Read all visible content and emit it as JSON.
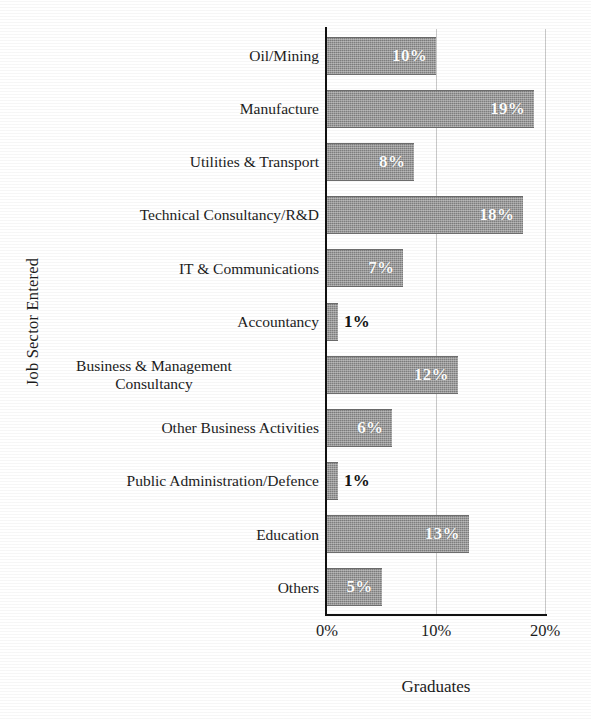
{
  "chart_data": {
    "type": "bar",
    "orientation": "horizontal",
    "title": "",
    "xlabel": "Graduates",
    "ylabel": "Job Sector Entered",
    "xlim": [
      0,
      20
    ],
    "xticks": [
      "0%",
      "10%",
      "20%"
    ],
    "xtick_values": [
      0,
      10,
      20
    ],
    "grid": "vertical gridlines at 10% and 20%",
    "legend": "none",
    "bar_color": "#7e7e7e",
    "value_label_color_inside": "#ffffff",
    "value_label_color_outside": "#141414",
    "categories": [
      "Oil/Mining",
      "Manufacture",
      "Utilities & Transport",
      "Technical Consultancy/R&D",
      "IT & Communications",
      "Accountancy",
      "Business & Management Consultancy",
      "Other Business Activities",
      "Public Administration/Defence",
      "Education",
      "Others"
    ],
    "values": [
      10,
      19,
      8,
      18,
      7,
      1,
      12,
      6,
      1,
      13,
      5
    ],
    "value_labels": [
      "10%",
      "19%",
      "8%",
      "18%",
      "7%",
      "1%",
      "12%",
      "6%",
      "1%",
      "13%",
      "5%"
    ],
    "label_placement": [
      "inside",
      "inside",
      "inside",
      "inside",
      "inside",
      "outside",
      "inside",
      "inside",
      "outside",
      "inside",
      "inside"
    ],
    "rows": [
      {
        "label": "Oil/Mining",
        "label_line1": "Oil/Mining",
        "label_line2": "",
        "value": 10,
        "value_label": "10%",
        "placement": "inside"
      },
      {
        "label": "Manufacture",
        "label_line1": "Manufacture",
        "label_line2": "",
        "value": 19,
        "value_label": "19%",
        "placement": "inside"
      },
      {
        "label": "Utilities & Transport",
        "label_line1": "Utilities & Transport",
        "label_line2": "",
        "value": 8,
        "value_label": "8%",
        "placement": "inside"
      },
      {
        "label": "Technical Consultancy/R&D",
        "label_line1": "Technical Consultancy/R&D",
        "label_line2": "",
        "value": 18,
        "value_label": "18%",
        "placement": "inside"
      },
      {
        "label": "IT & Communications",
        "label_line1": "IT & Communications",
        "label_line2": "",
        "value": 7,
        "value_label": "7%",
        "placement": "inside"
      },
      {
        "label": "Accountancy",
        "label_line1": "Accountancy",
        "label_line2": "",
        "value": 1,
        "value_label": "1%",
        "placement": "outside"
      },
      {
        "label": "Business & Management Consultancy",
        "label_line1": "Business & Management",
        "label_line2": "Consultancy",
        "value": 12,
        "value_label": "12%",
        "placement": "inside"
      },
      {
        "label": "Other Business Activities",
        "label_line1": "Other Business Activities",
        "label_line2": "",
        "value": 6,
        "value_label": "6%",
        "placement": "inside"
      },
      {
        "label": "Public Administration/Defence",
        "label_line1": "Public Administration/Defence",
        "label_line2": "",
        "value": 1,
        "value_label": "1%",
        "placement": "outside"
      },
      {
        "label": "Education",
        "label_line1": "Education",
        "label_line2": "",
        "value": 13,
        "value_label": "13%",
        "placement": "inside"
      },
      {
        "label": "Others",
        "label_line1": "Others",
        "label_line2": "",
        "value": 5,
        "value_label": "5%",
        "placement": "inside"
      }
    ]
  }
}
